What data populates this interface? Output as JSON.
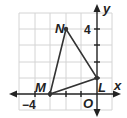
{
  "diagram": {
    "type": "coordinate-plane-triangle",
    "axes": {
      "x_label": "x",
      "y_label": "y",
      "origin_label": "O"
    },
    "tick_labels": {
      "x_tick": "−4",
      "y_tick": "4"
    },
    "grid": {
      "x_range": [
        -5,
        1
      ],
      "y_range": [
        -1,
        5
      ],
      "unit": 1
    },
    "vertices": [
      {
        "name": "N",
        "x": -2,
        "y": 4
      },
      {
        "name": "M",
        "x": -3,
        "y": 0
      },
      {
        "name": "L",
        "x": 0,
        "y": 1
      }
    ],
    "labels": {
      "N": "N",
      "M": "M",
      "L": "L"
    }
  }
}
